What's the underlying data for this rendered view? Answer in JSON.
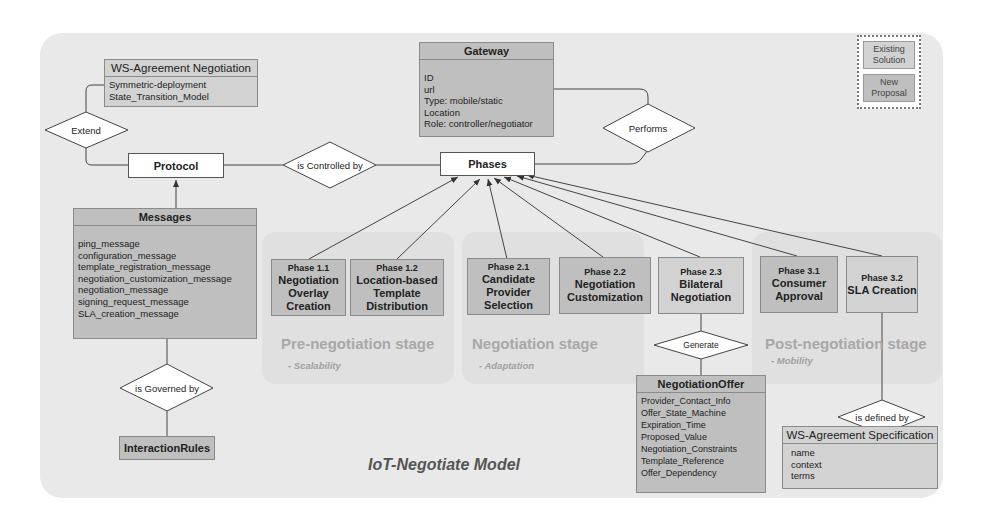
{
  "title": "IoT-Negotiate Model",
  "legend": {
    "existing": "Existing Solution",
    "proposal": "New Proposal"
  },
  "colors": {
    "panel": "#e9e9e9",
    "existing": "#d2d2d2",
    "proposal": "#bfbfbf",
    "stage_text": "#a8a8a8"
  },
  "entities": {
    "ws_negotiation": {
      "title": "WS-Agreement Negotiation",
      "attrs": [
        "Symmetric-deployment",
        "State_Transition_Model"
      ]
    },
    "gateway": {
      "title": "Gateway",
      "attrs": [
        "ID",
        "url",
        "Type: mobile/static",
        "Location",
        "Role: controller/negotiator"
      ]
    },
    "protocol": {
      "title": "Protocol"
    },
    "phases": {
      "title": "Phases"
    },
    "messages": {
      "title": "Messages",
      "attrs": [
        "ping_message",
        "configuration_message",
        "template_registration_message",
        "negotiation_customization_message",
        "negotiation_message",
        "signing_request_message",
        "SLA_creation_message"
      ]
    },
    "interaction_rules": {
      "title": "InteractionRules"
    },
    "negotiation_offer": {
      "title": "NegotiationOffer",
      "attrs": [
        "Provider_Contact_Info",
        "Offer_State_Machine",
        "Expiration_Time",
        "Proposed_Value",
        "Negotiation_Constraints",
        "Template_Reference",
        "Offer_Dependency"
      ]
    },
    "ws_spec": {
      "title": "WS-Agreement Specification",
      "attrs": [
        "name",
        "context",
        "terms"
      ]
    }
  },
  "relationships": {
    "extend": "Extend",
    "controlled": "is Controlled by",
    "performs": "Performs",
    "governed": "is Governed by",
    "generate": "Generate",
    "defined": "is defined by"
  },
  "phases": [
    {
      "num": "Phase 1.1",
      "name": "Negotiation Overlay Creation"
    },
    {
      "num": "Phase 1.2",
      "name": "Location-based Template Distribution"
    },
    {
      "num": "Phase 2.1",
      "name": "Candidate Provider Selection"
    },
    {
      "num": "Phase 2.2",
      "name": "Negotiation Customization"
    },
    {
      "num": "Phase 2.3",
      "name": "Bilateral Negotiation"
    },
    {
      "num": "Phase 3.1",
      "name": "Consumer Approval"
    },
    {
      "num": "Phase 3.2",
      "name": "SLA Creation"
    }
  ],
  "stages": [
    {
      "title": "Pre-negotiation stage",
      "sub": "- Scalability"
    },
    {
      "title": "Negotiation stage",
      "sub": "- Adaptation"
    },
    {
      "title": "Post-negotiation stage",
      "sub": "- Mobility"
    }
  ]
}
